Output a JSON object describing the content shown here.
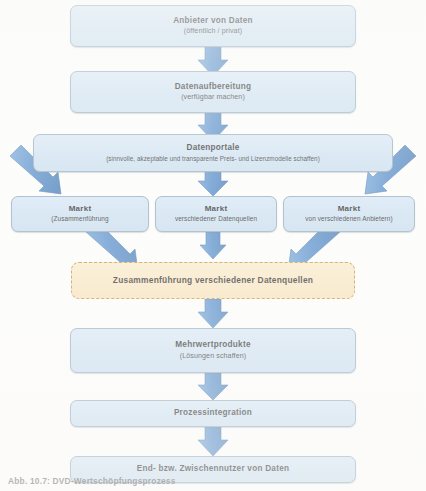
{
  "figure": {
    "type": "flowchart",
    "language": "de",
    "caption_partial": "Abb. 10.7:  DVD-Wertschöpfungsprozess",
    "colors": {
      "node_fill": "#cfe2f3",
      "node_border": "#8fa8bd",
      "arrow_fill": "#4a86c8",
      "arrow_stroke": "#2f6ba8",
      "highlight_fill": "#f7e3bb",
      "highlight_border": "#c08a2e",
      "text": "#1a1a1a",
      "page_background": "#fdfdfc"
    }
  },
  "nodes": [
    {
      "id": "anbieter",
      "name": "node-anbieter-von-daten",
      "title": "Anbieter von Daten",
      "subtitle": "(öffentlich / privat)",
      "level": 1
    },
    {
      "id": "aufbereitung",
      "name": "node-datenaufbereitung",
      "title": "Datenaufbereitung",
      "subtitle": "(verfügbar machen)",
      "level": 2
    },
    {
      "id": "portale",
      "name": "node-datenportale",
      "title": "Datenportale",
      "subtitle": "(sinnvolle, akzeptable und transparente Preis- und Lizenzmodelle schaffen)",
      "level": 3
    },
    {
      "id": "markt-links",
      "name": "node-markt-zusammenfuehrung",
      "title": "Markt",
      "subtitle": "(Zusammenführung",
      "level": 4
    },
    {
      "id": "markt-mitte",
      "name": "node-markt-datenquellen",
      "title": "Markt",
      "subtitle": "verschiedener Datenquellen",
      "level": 4
    },
    {
      "id": "markt-rechts",
      "name": "node-markt-anbietern",
      "title": "Markt",
      "subtitle": "von verschiedenen Anbietern)",
      "level": 4
    },
    {
      "id": "zusammenfuehrung",
      "name": "node-zusammenfuehrung-datenquellen",
      "title": "Zusammenführung verschiedener Datenquellen",
      "subtitle": "",
      "level": 5,
      "highlighted": true
    },
    {
      "id": "mehrwert",
      "name": "node-mehrwertprodukte",
      "title": "Mehrwertprodukte",
      "subtitle": "(Lösungen schaffen)",
      "level": 6
    },
    {
      "id": "prozess",
      "name": "node-prozessintegration",
      "title": "Prozessintegration",
      "subtitle": "",
      "level": 7
    },
    {
      "id": "nutzer",
      "name": "node-endnutzer",
      "title": "End- bzw. Zwischennutzer von Daten",
      "subtitle": "",
      "level": 8
    }
  ],
  "edges": [
    {
      "from": "anbieter",
      "to": "aufbereitung",
      "shape": "vertical"
    },
    {
      "from": "aufbereitung",
      "to": "portale",
      "shape": "vertical"
    },
    {
      "from": "portale",
      "to": "markt-links",
      "shape": "diagonal-down-right"
    },
    {
      "from": "portale",
      "to": "markt-mitte",
      "shape": "vertical"
    },
    {
      "from": "portale",
      "to": "markt-rechts",
      "shape": "diagonal-down-left"
    },
    {
      "from": "markt-links",
      "to": "zusammenfuehrung",
      "shape": "diagonal-down-right"
    },
    {
      "from": "markt-mitte",
      "to": "zusammenfuehrung",
      "shape": "vertical"
    },
    {
      "from": "markt-rechts",
      "to": "zusammenfuehrung",
      "shape": "diagonal-down-left"
    },
    {
      "from": "zusammenfuehrung",
      "to": "mehrwert",
      "shape": "vertical"
    },
    {
      "from": "mehrwert",
      "to": "prozess",
      "shape": "vertical"
    },
    {
      "from": "prozess",
      "to": "nutzer",
      "shape": "vertical"
    }
  ]
}
